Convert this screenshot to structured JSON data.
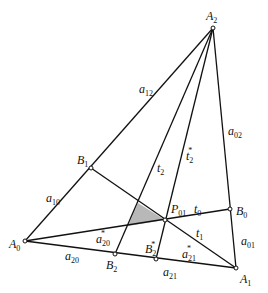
{
  "diagram": {
    "points": {
      "A0": {
        "x": 25,
        "y": 241
      },
      "A1": {
        "x": 236,
        "y": 268
      },
      "A2": {
        "x": 213,
        "y": 28
      },
      "B0": {
        "x": 230,
        "y": 209
      },
      "B1": {
        "x": 91,
        "y": 168
      },
      "B2": {
        "x": 115,
        "y": 254
      },
      "B2star": {
        "x": 156,
        "y": 259
      },
      "P01": {
        "x": 165,
        "y": 220
      }
    },
    "shaded_triangle": [
      [
        138,
        203
      ],
      [
        128,
        226
      ],
      [
        165,
        220
      ]
    ],
    "shade_color": "#b8b8b8",
    "line_color": "#111111",
    "labels": {
      "A0": {
        "base": "A",
        "sub": "0"
      },
      "A1": {
        "base": "A",
        "sub": "1"
      },
      "A2": {
        "base": "A",
        "sub": "2"
      },
      "B0": {
        "base": "B",
        "sub": "0"
      },
      "B1": {
        "base": "B",
        "sub": "1"
      },
      "B2": {
        "base": "B",
        "sub": "2"
      },
      "B2star": {
        "base": "B",
        "sub": "2",
        "sup": "*"
      },
      "P01": {
        "base": "P",
        "sub": "01"
      },
      "a12": {
        "base": "a",
        "sub": "12"
      },
      "a02": {
        "base": "a",
        "sub": "02"
      },
      "a01": {
        "base": "a",
        "sub": "01"
      },
      "a10": {
        "base": "a",
        "sub": "10"
      },
      "a20": {
        "base": "a",
        "sub": "20"
      },
      "a21": {
        "base": "a",
        "sub": "21"
      },
      "a20star": {
        "base": "a",
        "sub": "20",
        "sup": "*"
      },
      "a21star": {
        "base": "a",
        "sub": "21",
        "sup": "*"
      },
      "t0": {
        "base": "t",
        "sub": "0"
      },
      "t1": {
        "base": "t",
        "sub": "1"
      },
      "t2": {
        "base": "t",
        "sub": "2"
      },
      "t2star": {
        "base": "t",
        "sub": "2",
        "sup": "*"
      }
    }
  }
}
